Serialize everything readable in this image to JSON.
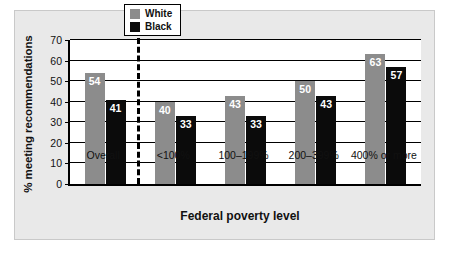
{
  "chart_data": {
    "type": "bar",
    "title": "",
    "subtitle": "",
    "xlabel": "Federal poverty level",
    "ylabel": "% meeting recommendations",
    "categories": [
      "Overall",
      "<100%",
      "100–199%",
      "200–399%",
      "400% or more"
    ],
    "series": [
      {
        "name": "White",
        "color": "#8c8c8c",
        "values": [
          54,
          40,
          43,
          50,
          63
        ]
      },
      {
        "name": "Black",
        "color": "#0b0b0b",
        "values": [
          41,
          33,
          33,
          43,
          57
        ]
      }
    ],
    "ylim": [
      0,
      70
    ],
    "ytick_labels": [
      "0",
      "10",
      "20",
      "30",
      "40",
      "50",
      "60",
      "70"
    ],
    "ytick_values": [
      0,
      10,
      20,
      30,
      40,
      50,
      60,
      70
    ],
    "grid": "horizontal",
    "legend_position": "top-center",
    "annotations": [
      {
        "name": "overall-separator",
        "type": "dashed-vertical-line",
        "after_category": "Overall"
      }
    ]
  },
  "legend": {
    "entries": [
      {
        "label": "White"
      },
      {
        "label": "Black"
      }
    ]
  },
  "axes": {
    "x_title": "Federal poverty level",
    "y_title": "% meeting recommendations"
  },
  "colors": {
    "white_series": "#8c8c8c",
    "black_series": "#0b0b0b",
    "axis": "#000000",
    "card_background": "#e9e9e9",
    "plot_background": "#ffffff",
    "value_label": "#ffffff"
  }
}
